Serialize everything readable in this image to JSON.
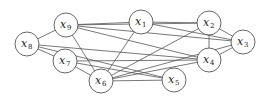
{
  "graph": {
    "radius": 12,
    "nodes": [
      {
        "id": "x1",
        "label": "x",
        "sub": "1",
        "x": 141,
        "y": 22
      },
      {
        "id": "x2",
        "label": "x",
        "sub": "2",
        "x": 209,
        "y": 23
      },
      {
        "id": "x3",
        "label": "x",
        "sub": "3",
        "x": 243,
        "y": 42
      },
      {
        "id": "x4",
        "label": "x",
        "sub": "4",
        "x": 209,
        "y": 60
      },
      {
        "id": "x5",
        "label": "x",
        "sub": "5",
        "x": 174,
        "y": 80
      },
      {
        "id": "x6",
        "label": "x",
        "sub": "6",
        "x": 101,
        "y": 81
      },
      {
        "id": "x7",
        "label": "x",
        "sub": "7",
        "x": 65,
        "y": 61
      },
      {
        "id": "x8",
        "label": "x",
        "sub": "8",
        "x": 27,
        "y": 44
      },
      {
        "id": "x9",
        "label": "x",
        "sub": "9",
        "x": 66,
        "y": 25
      }
    ],
    "edges": [
      [
        "x9",
        "x8"
      ],
      [
        "x9",
        "x1"
      ],
      [
        "x9",
        "x2"
      ],
      [
        "x9",
        "x3"
      ],
      [
        "x9",
        "x4"
      ],
      [
        "x9",
        "x6"
      ],
      [
        "x8",
        "x7"
      ],
      [
        "x8",
        "x4"
      ],
      [
        "x8",
        "x5"
      ],
      [
        "x7",
        "x6"
      ],
      [
        "x7",
        "x4"
      ],
      [
        "x7",
        "x5"
      ],
      [
        "x1",
        "x2"
      ],
      [
        "x1",
        "x3"
      ],
      [
        "x1",
        "x6"
      ],
      [
        "x2",
        "x3"
      ],
      [
        "x2",
        "x4"
      ],
      [
        "x2",
        "x6"
      ],
      [
        "x3",
        "x4"
      ],
      [
        "x3",
        "x6"
      ],
      [
        "x6",
        "x4"
      ],
      [
        "x6",
        "x5"
      ]
    ]
  }
}
